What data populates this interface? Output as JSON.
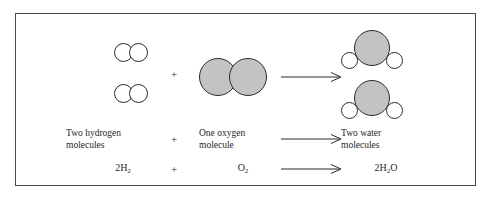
{
  "figure": {
    "caption_row": {
      "reactant1": "Two hydrogen\nmolecules",
      "reactant1_line1": "Two hydrogen",
      "reactant1_line2": "molecules",
      "operator": "+",
      "reactant2_line1": "One oxygen",
      "reactant2_line2": "molecule",
      "yields": "arrow-right-icon",
      "product_line1": "Two water",
      "product_line2": "molecules"
    },
    "equation_row": {
      "reactant1_coefficient": "2",
      "reactant1_element": "H",
      "reactant1_subscript": "2",
      "operator": "+",
      "reactant2_element": "O",
      "reactant2_subscript": "2",
      "yields": "arrow-right-icon",
      "product_coefficient": "2",
      "product_element1": "H",
      "product_subscript": "2",
      "product_element2": "O"
    },
    "diagram_row": {
      "hydrogen_molecule_1": "hydrogen-molecule-icon",
      "hydrogen_molecule_2": "hydrogen-molecule-icon",
      "operator": "+",
      "oxygen_molecule": "oxygen-molecule-icon",
      "yields": "arrow-right-icon",
      "water_molecule_1": "water-molecule-icon",
      "water_molecule_2": "water-molecule-icon"
    },
    "colors": {
      "oxygen_atom_fill": "#c3c3c3",
      "hydrogen_atom_fill": "#ffffff",
      "atom_outline": "#2b2b2b",
      "frame_border": "#4a4a4a",
      "background": "#ffffff",
      "text": "#1f1f1f"
    }
  }
}
